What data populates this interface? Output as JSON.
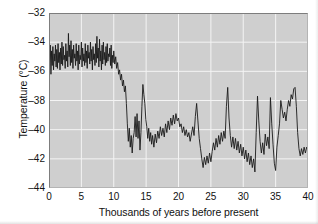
{
  "chart_data": {
    "type": "line",
    "title": "",
    "xlabel": "Thousands of years before present",
    "ylabel": "Temperature (°C)",
    "xlim": [
      0,
      40
    ],
    "ylim": [
      -44,
      -32
    ],
    "xticks": [
      0,
      5,
      10,
      15,
      20,
      25,
      30,
      35,
      40
    ],
    "xtick_labels": [
      "0",
      "5",
      "10",
      "15",
      "20",
      "25",
      "30",
      "35",
      "40"
    ],
    "yticks": [
      -32,
      -34,
      -36,
      -38,
      -40,
      -42,
      -44
    ],
    "ytick_labels": [
      "–32",
      "–34",
      "–36",
      "–38",
      "–40",
      "–42",
      "–44"
    ],
    "grid": true,
    "grid_color": "#f4f4f4",
    "panel_color": "#cfcfcf",
    "line_color": "#1a1a1a",
    "line_width": 0.9,
    "legend": null,
    "series": [
      {
        "name": "Ice core temperature",
        "x": [
          0.0,
          0.1,
          0.2,
          0.3,
          0.4,
          0.5,
          0.6,
          0.7,
          0.8,
          0.9,
          1.0,
          1.1,
          1.2,
          1.3,
          1.4,
          1.5,
          1.6,
          1.7,
          1.8,
          1.9,
          2.0,
          2.1,
          2.2,
          2.3,
          2.4,
          2.5,
          2.6,
          2.7,
          2.8,
          2.9,
          3.0,
          3.1,
          3.2,
          3.3,
          3.4,
          3.5,
          3.6,
          3.7,
          3.8,
          3.9,
          4.0,
          4.1,
          4.2,
          4.3,
          4.4,
          4.5,
          4.6,
          4.7,
          4.8,
          4.9,
          5.0,
          5.1,
          5.2,
          5.3,
          5.4,
          5.5,
          5.6,
          5.7,
          5.8,
          5.9,
          6.0,
          6.1,
          6.2,
          6.3,
          6.4,
          6.5,
          6.6,
          6.7,
          6.8,
          6.9,
          7.0,
          7.1,
          7.2,
          7.3,
          7.4,
          7.5,
          7.6,
          7.7,
          7.8,
          7.9,
          8.0,
          8.1,
          8.2,
          8.3,
          8.4,
          8.5,
          8.6,
          8.7,
          8.8,
          8.9,
          9.0,
          9.1,
          9.2,
          9.3,
          9.4,
          9.5,
          9.6,
          9.7,
          9.8,
          9.9,
          10.0,
          10.15,
          10.3,
          10.45,
          10.6,
          10.75,
          10.9,
          11.05,
          11.2,
          11.35,
          11.5,
          11.65,
          11.8,
          11.95,
          12.1,
          12.25,
          12.4,
          12.55,
          12.7,
          12.85,
          13.0,
          13.15,
          13.3,
          13.45,
          13.6,
          13.75,
          13.9,
          14.05,
          14.2,
          14.35,
          14.5,
          14.65,
          14.8,
          14.95,
          15.1,
          15.25,
          15.4,
          15.55,
          15.7,
          15.85,
          16.0,
          16.2,
          16.4,
          16.6,
          16.8,
          17.0,
          17.2,
          17.4,
          17.6,
          17.8,
          18.0,
          18.2,
          18.4,
          18.6,
          18.8,
          19.0,
          19.2,
          19.4,
          19.6,
          19.8,
          20.0,
          20.2,
          20.4,
          20.6,
          20.8,
          21.0,
          21.2,
          21.4,
          21.6,
          21.8,
          22.0,
          22.2,
          22.4,
          22.6,
          22.8,
          23.0,
          23.2,
          23.4,
          23.6,
          23.8,
          24.0,
          24.2,
          24.4,
          24.6,
          24.8,
          25.0,
          25.2,
          25.4,
          25.6,
          25.8,
          26.0,
          26.2,
          26.4,
          26.6,
          26.8,
          27.0,
          27.2,
          27.4,
          27.6,
          27.8,
          28.0,
          28.2,
          28.4,
          28.6,
          28.8,
          29.0,
          29.2,
          29.4,
          29.6,
          29.8,
          30.0,
          30.2,
          30.4,
          30.6,
          30.8,
          31.0,
          31.2,
          31.4,
          31.6,
          31.8,
          32.0,
          32.2,
          32.4,
          32.6,
          32.8,
          33.0,
          33.2,
          33.4,
          33.6,
          33.8,
          34.0,
          34.2,
          34.4,
          34.6,
          34.8,
          35.0,
          35.2,
          35.4,
          35.6,
          35.8,
          36.0,
          36.2,
          36.4,
          36.6,
          36.8,
          37.0,
          37.2,
          37.4,
          37.6,
          37.8,
          38.0,
          38.2,
          38.4,
          38.6,
          38.8,
          39.0,
          39.2,
          39.4,
          39.6,
          39.8,
          40.0
        ],
        "y": [
          -33.6,
          -35.2,
          -34.2,
          -36.2,
          -34.6,
          -35.6,
          -34.3,
          -35.9,
          -34.8,
          -35.3,
          -34.2,
          -35.7,
          -34.5,
          -35.8,
          -34.1,
          -35.4,
          -34.7,
          -35.9,
          -34.4,
          -35.5,
          -34.0,
          -35.6,
          -34.3,
          -35.2,
          -34.9,
          -35.8,
          -34.1,
          -35.3,
          -34.6,
          -35.7,
          -33.4,
          -35.0,
          -34.2,
          -35.6,
          -33.9,
          -35.4,
          -34.5,
          -35.8,
          -34.2,
          -35.1,
          -34.8,
          -35.6,
          -34.1,
          -35.3,
          -34.6,
          -35.9,
          -34.2,
          -35.5,
          -34.9,
          -35.2,
          -34.0,
          -35.7,
          -34.4,
          -35.3,
          -34.8,
          -35.6,
          -34.1,
          -35.4,
          -34.6,
          -35.8,
          -34.2,
          -35.1,
          -34.7,
          -35.5,
          -34.0,
          -35.3,
          -34.5,
          -35.9,
          -34.3,
          -35.2,
          -34.8,
          -35.6,
          -34.1,
          -35.4,
          -33.6,
          -35.1,
          -34.4,
          -35.7,
          -33.8,
          -35.3,
          -34.6,
          -35.9,
          -34.2,
          -35.5,
          -34.0,
          -35.2,
          -34.7,
          -35.6,
          -34.3,
          -35.4,
          -34.1,
          -35.3,
          -34.8,
          -35.0,
          -34.4,
          -35.6,
          -34.2,
          -35.8,
          -34.9,
          -35.4,
          -34.6,
          -35.5,
          -35.0,
          -35.8,
          -35.4,
          -36.2,
          -35.9,
          -36.6,
          -36.2,
          -37.0,
          -36.6,
          -37.4,
          -37.0,
          -38.2,
          -39.6,
          -40.8,
          -39.9,
          -41.2,
          -40.4,
          -41.6,
          -40.6,
          -40.2,
          -39.1,
          -40.5,
          -38.9,
          -40.6,
          -39.4,
          -41.4,
          -40.2,
          -38.4,
          -36.9,
          -37.6,
          -38.2,
          -39.3,
          -39.8,
          -40.6,
          -39.9,
          -40.8,
          -40.2,
          -41.0,
          -40.4,
          -41.2,
          -40.3,
          -40.9,
          -40.1,
          -40.6,
          -39.8,
          -40.4,
          -39.9,
          -40.5,
          -39.6,
          -40.2,
          -39.4,
          -40.0,
          -39.2,
          -39.7,
          -39.0,
          -39.6,
          -38.9,
          -39.4,
          -39.2,
          -39.8,
          -39.6,
          -40.2,
          -39.8,
          -40.4,
          -40.0,
          -40.5,
          -40.2,
          -40.8,
          -40.3,
          -39.8,
          -40.4,
          -39.1,
          -38.2,
          -39.4,
          -40.6,
          -41.3,
          -42.0,
          -42.6,
          -41.9,
          -42.4,
          -41.8,
          -42.3,
          -41.6,
          -42.2,
          -41.5,
          -40.9,
          -41.4,
          -40.6,
          -41.2,
          -40.4,
          -41.0,
          -40.2,
          -40.8,
          -40.1,
          -40.6,
          -38.4,
          -37.1,
          -39.2,
          -40.4,
          -41.2,
          -40.5,
          -41.3,
          -40.6,
          -41.4,
          -40.8,
          -41.6,
          -41.0,
          -41.8,
          -41.2,
          -42.0,
          -41.4,
          -42.2,
          -41.6,
          -42.4,
          -41.8,
          -42.6,
          -42.0,
          -42.9,
          -40.2,
          -37.7,
          -39.4,
          -40.8,
          -41.6,
          -40.9,
          -41.7,
          -40.3,
          -41.1,
          -40.5,
          -41.3,
          -37.8,
          -39.6,
          -41.0,
          -42.3,
          -42.8,
          -41.2,
          -40.4,
          -39.6,
          -38.0,
          -38.6,
          -39.2,
          -38.8,
          -39.4,
          -38.6,
          -38.0,
          -38.4,
          -37.6,
          -37.9,
          -37.2,
          -37.1,
          -38.4,
          -40.2,
          -41.3,
          -41.8,
          -41.3,
          -41.7,
          -41.2,
          -41.6,
          -41.2,
          -41.4
        ]
      }
    ]
  }
}
